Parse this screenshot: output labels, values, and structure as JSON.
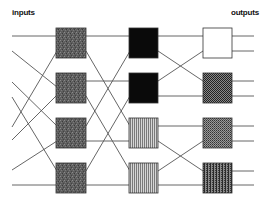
{
  "labels": {
    "inputs": "inputs",
    "outputs": "outputs"
  },
  "colors": {
    "wire": "#555555",
    "speckled_gray": "#5e5e5e",
    "black": "#0a0a0a",
    "white": "#ffffff",
    "stripe_light": "#bdbdbd",
    "stripe_dark": "#6a6a6a",
    "checker_dark": "#3a3a3a",
    "checker_light": "#9a9a9a"
  },
  "diagram": {
    "type": "shuffle-exchange network",
    "stages": [
      {
        "name": "stage-1",
        "boxes": [
          {
            "row": 1,
            "fill": "speckled-gray"
          },
          {
            "row": 2,
            "fill": "speckled-gray"
          },
          {
            "row": 3,
            "fill": "speckled-gray"
          },
          {
            "row": 4,
            "fill": "speckled-gray"
          }
        ]
      },
      {
        "name": "stage-2",
        "boxes": [
          {
            "row": 1,
            "fill": "black"
          },
          {
            "row": 2,
            "fill": "black"
          },
          {
            "row": 3,
            "fill": "vertical-stripes"
          },
          {
            "row": 4,
            "fill": "vertical-stripes"
          }
        ]
      },
      {
        "name": "stage-3",
        "boxes": [
          {
            "row": 1,
            "fill": "white"
          },
          {
            "row": 2,
            "fill": "dark-checker"
          },
          {
            "row": 3,
            "fill": "gray-checker"
          },
          {
            "row": 4,
            "fill": "checker-stripes"
          }
        ]
      }
    ],
    "input_count": 8,
    "output_count": 8
  }
}
